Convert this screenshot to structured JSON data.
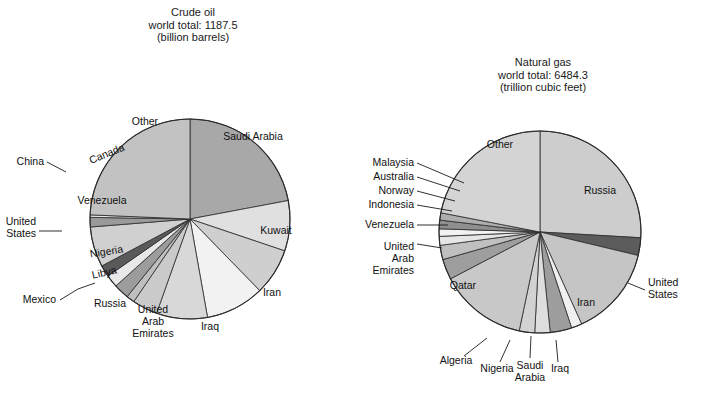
{
  "figure": {
    "width": 706,
    "height": 394,
    "background": "#ffffff"
  },
  "palette": {
    "light": "#e8e8e8",
    "lighter": "#f1f1f1",
    "white": "#fbfbfb",
    "mid_light": "#d5d5d5",
    "mid": "#c6c6c6",
    "mid2": "#bdbdbd",
    "gray": "#b0b0b0",
    "medium": "#a8a8a8",
    "dark": "#8c8c8c",
    "darker": "#6e6e6e",
    "darkest": "#5a5a5a",
    "outline": "#2b2b2b",
    "text": "#111111"
  },
  "chart_data": [
    {
      "type": "pie",
      "id": "crude-oil",
      "title": "Crude oil",
      "subtitle": "world total: 1187.5",
      "units": "(billion barrels)",
      "title_lines": [
        "Crude oil",
        "world total: 1187.5",
        "(billion barrels)"
      ],
      "total": 1187.5,
      "unit_name": "billion barrels",
      "center": [
        190,
        219
      ],
      "radius": 100,
      "start_angle_deg": 0,
      "direction": "clockwise",
      "categories": [
        "Saudi Arabia",
        "Kuwait",
        "Iran",
        "Iraq",
        "United Arab Emirates",
        "Russia",
        "Mexico",
        "Libya",
        "Nigeria",
        "United States",
        "Venezuela",
        "China",
        "Canada",
        "Other"
      ],
      "values": [
        261.7,
        96.5,
        89.7,
        112.5,
        97.8,
        48.6,
        15.7,
        29.5,
        24.0,
        22.4,
        77.2,
        18.3,
        4.7,
        288.9
      ],
      "percents": [
        22.04,
        8.13,
        7.55,
        9.47,
        8.23,
        4.09,
        1.32,
        2.48,
        2.02,
        1.89,
        6.5,
        1.54,
        0.4,
        24.34
      ],
      "slices": [
        {
          "label": "Saudi Arabia",
          "value": 261.7,
          "percent": 22.04,
          "fill": "#a8a8a8",
          "label_mode": "inside",
          "label_x": 253,
          "label_y": 140,
          "label_rot": 0,
          "label_anchor": "middle",
          "lines": [
            "Saudi Arabia"
          ]
        },
        {
          "label": "Kuwait",
          "value": 96.5,
          "percent": 8.13,
          "fill": "#e0e0e0",
          "label_mode": "inside",
          "label_x": 276,
          "label_y": 234,
          "label_rot": 0,
          "label_anchor": "middle",
          "lines": [
            "Kuwait"
          ]
        },
        {
          "label": "Iran",
          "value": 89.7,
          "percent": 7.55,
          "fill": "#cfcfcf",
          "label_mode": "inside",
          "label_x": 272,
          "label_y": 296,
          "label_rot": 0,
          "label_anchor": "middle",
          "lines": [
            "Iran"
          ]
        },
        {
          "label": "Iraq",
          "value": 112.5,
          "percent": 9.47,
          "fill": "#f2f2f2",
          "label_mode": "inside",
          "label_x": 210,
          "label_y": 330,
          "label_rot": 0,
          "label_anchor": "middle",
          "lines": [
            "Iraq"
          ]
        },
        {
          "label": "United Arab Emirates",
          "value": 97.8,
          "percent": 8.23,
          "fill": "#d8d8d8",
          "label_mode": "inside",
          "label_x": 153,
          "label_y": 313,
          "label_rot": 0,
          "label_anchor": "middle",
          "lines": [
            "United",
            "Arab",
            "Emirates"
          ]
        },
        {
          "label": "Russia",
          "value": 48.6,
          "percent": 4.09,
          "fill": "#cacaca",
          "label_mode": "inside",
          "label_x": 110,
          "label_y": 307,
          "label_rot": 0,
          "label_anchor": "middle",
          "lines": [
            "Russia"
          ]
        },
        {
          "label": "Mexico",
          "value": 15.7,
          "percent": 1.32,
          "fill": "#bfbfbf",
          "label_mode": "leader",
          "label_x": 56,
          "label_y": 303,
          "label_rot": 0,
          "label_anchor": "end",
          "leader": [
            [
              60,
              300
            ],
            [
              78,
              289
            ],
            [
              95,
              283
            ]
          ],
          "lines": [
            "Mexico"
          ]
        },
        {
          "label": "Libya",
          "value": 29.5,
          "percent": 2.48,
          "fill": "#9c9c9c",
          "label_mode": "inside",
          "label_x": 105,
          "label_y": 276,
          "label_rot": -13,
          "label_anchor": "middle",
          "lines": [
            "Libya"
          ]
        },
        {
          "label": "Nigeria",
          "value": 24.0,
          "percent": 2.02,
          "fill": "#e8e8e8",
          "label_mode": "inside",
          "label_x": 107,
          "label_y": 255,
          "label_rot": -9,
          "label_anchor": "middle",
          "lines": [
            "Nigeria"
          ]
        },
        {
          "label": "United States",
          "value": 22.4,
          "percent": 1.89,
          "fill": "#5a5a5a",
          "label_mode": "leader",
          "label_x": 36,
          "label_y": 225,
          "label_rot": 0,
          "label_anchor": "end",
          "leader": [
            [
              39,
              231
            ],
            [
              62,
              231
            ]
          ],
          "lines": [
            "United",
            "States"
          ]
        },
        {
          "label": "Venezuela",
          "value": 77.2,
          "percent": 6.5,
          "fill": "#d0d0d0",
          "label_mode": "inside",
          "label_x": 102,
          "label_y": 204,
          "label_rot": 0,
          "label_anchor": "middle",
          "lines": [
            "Venezuela"
          ]
        },
        {
          "label": "China",
          "value": 18.3,
          "percent": 1.54,
          "fill": "#9a9a9a",
          "label_mode": "leader",
          "label_x": 44,
          "label_y": 165,
          "label_rot": 0,
          "label_anchor": "end",
          "leader": [
            [
              47,
              162
            ],
            [
              66,
              172
            ]
          ],
          "lines": [
            "China"
          ]
        },
        {
          "label": "Canada",
          "value": 4.7,
          "percent": 0.4,
          "fill": "#e4e4e4",
          "label_mode": "inside",
          "label_x": 108,
          "label_y": 157,
          "label_rot": -22,
          "label_anchor": "middle",
          "lines": [
            "Canada"
          ]
        },
        {
          "label": "Other",
          "value": 288.9,
          "percent": 24.34,
          "fill": "#c2c2c2",
          "label_mode": "inside",
          "label_x": 145,
          "label_y": 125,
          "label_rot": 0,
          "label_anchor": "middle",
          "lines": [
            "Other"
          ]
        }
      ]
    },
    {
      "type": "pie",
      "id": "natural-gas",
      "title": "Natural gas",
      "subtitle": "world total: 6484.3",
      "units": "(trillion cubic feet)",
      "title_lines": [
        "Natural gas",
        "world total: 6484.3",
        "(trillion cubic feet)"
      ],
      "total": 6484.3,
      "unit_name": "trillion cubic feet",
      "center": [
        540,
        232
      ],
      "radius": 101,
      "start_angle_deg": 0,
      "direction": "clockwise",
      "categories": [
        "Russia",
        "United States",
        "Iran",
        "Iraq",
        "Saudi Arabia",
        "Nigeria",
        "Algeria",
        "Qatar",
        "United Arab Emirates",
        "Venezuela",
        "Indonesia",
        "Norway",
        "Australia",
        "Malaysia",
        "Other"
      ],
      "values": [
        1680.0,
        183.5,
        940.0,
        110.0,
        224.0,
        159.0,
        160.0,
        910.0,
        212.0,
        148.0,
        92.5,
        77.0,
        90.0,
        75.0,
        1423.3
      ],
      "percents": [
        25.91,
        2.83,
        14.5,
        1.7,
        3.45,
        2.45,
        2.47,
        14.03,
        3.27,
        2.28,
        1.43,
        1.19,
        1.39,
        1.16,
        21.95
      ],
      "slices": [
        {
          "label": "Russia",
          "value": 1680.0,
          "percent": 25.91,
          "fill": "#cdcdcd",
          "label_mode": "inside",
          "label_x": 600,
          "label_y": 194,
          "label_rot": 0,
          "label_anchor": "middle",
          "lines": [
            "Russia"
          ]
        },
        {
          "label": "United States",
          "value": 183.5,
          "percent": 2.83,
          "fill": "#5c5c5c",
          "label_mode": "leader",
          "label_x": 648,
          "label_y": 286,
          "label_rot": 0,
          "label_anchor": "start",
          "leader": [
            [
              645,
              290
            ],
            [
              628,
              283
            ]
          ],
          "lines": [
            "United",
            "States"
          ]
        },
        {
          "label": "Iran",
          "value": 940.0,
          "percent": 14.5,
          "fill": "#c5c5c5",
          "label_mode": "inside",
          "label_x": 586,
          "label_y": 306,
          "label_rot": 0,
          "label_anchor": "middle",
          "lines": [
            "Iran"
          ]
        },
        {
          "label": "Iraq",
          "value": 110.0,
          "percent": 1.7,
          "fill": "#f0f0f0",
          "label_mode": "leader",
          "label_x": 560,
          "label_y": 372,
          "label_rot": 0,
          "label_anchor": "middle",
          "leader": [
            [
              558,
              362
            ],
            [
              556,
              340
            ]
          ],
          "lines": [
            "Iraq"
          ]
        },
        {
          "label": "Saudi Arabia",
          "value": 224.0,
          "percent": 3.45,
          "fill": "#9d9d9d",
          "label_mode": "leader",
          "label_x": 530,
          "label_y": 369,
          "label_rot": 0,
          "label_anchor": "middle",
          "leader": [
            [
              530,
              358
            ],
            [
              531,
              336
            ]
          ],
          "lines": [
            "Saudi",
            "Arabia"
          ]
        },
        {
          "label": "Nigeria",
          "value": 159.0,
          "percent": 2.45,
          "fill": "#dedede",
          "label_mode": "leader",
          "label_x": 497,
          "label_y": 372,
          "label_rot": 0,
          "label_anchor": "middle",
          "leader": [
            [
              500,
              362
            ],
            [
              510,
              340
            ]
          ],
          "lines": [
            "Nigeria"
          ]
        },
        {
          "label": "Algeria",
          "value": 160.0,
          "percent": 2.47,
          "fill": "#d2d2d2",
          "label_mode": "leader",
          "label_x": 456,
          "label_y": 364,
          "label_rot": 0,
          "label_anchor": "middle",
          "leader": [
            [
              464,
              356
            ],
            [
              487,
              338
            ]
          ],
          "lines": [
            "Algeria"
          ]
        },
        {
          "label": "Qatar",
          "value": 910.0,
          "percent": 14.03,
          "fill": "#c8c8c8",
          "label_mode": "inside",
          "label_x": 463,
          "label_y": 289,
          "label_rot": 0,
          "label_anchor": "middle",
          "lines": [
            "Qatar"
          ]
        },
        {
          "label": "United Arab Emirates",
          "value": 212.0,
          "percent": 3.27,
          "fill": "#9e9e9e",
          "label_mode": "leader",
          "label_x": 414,
          "label_y": 250,
          "label_rot": 0,
          "label_anchor": "end",
          "leader": [
            [
              417,
              244
            ],
            [
              442,
              248
            ]
          ],
          "lines": [
            "United",
            "Arab",
            "Emirates"
          ]
        },
        {
          "label": "Venezuela",
          "value": 148.0,
          "percent": 2.28,
          "fill": "#c0c0c0",
          "label_mode": "leader",
          "label_x": 414,
          "label_y": 228,
          "label_rot": 0,
          "label_anchor": "end",
          "leader": [
            [
              417,
              225
            ],
            [
              448,
              225
            ]
          ],
          "lines": [
            "Venezuela"
          ]
        },
        {
          "label": "Indonesia",
          "value": 92.5,
          "percent": 1.43,
          "fill": "#e6e6e6",
          "label_mode": "leader",
          "label_x": 414,
          "label_y": 208,
          "label_rot": 0,
          "label_anchor": "end",
          "leader": [
            [
              417,
              205
            ],
            [
              452,
              211
            ]
          ],
          "lines": [
            "Indonesia"
          ]
        },
        {
          "label": "Norway",
          "value": 77.0,
          "percent": 1.19,
          "fill": "#f2f2f2",
          "label_mode": "leader",
          "label_x": 414,
          "label_y": 194,
          "label_rot": 0,
          "label_anchor": "end",
          "leader": [
            [
              417,
              191
            ],
            [
              455,
              201
            ]
          ],
          "lines": [
            "Norway"
          ]
        },
        {
          "label": "Australia",
          "value": 90.0,
          "percent": 1.39,
          "fill": "#8f8f8f",
          "label_mode": "leader",
          "label_x": 414,
          "label_y": 180,
          "label_rot": 0,
          "label_anchor": "end",
          "leader": [
            [
              417,
              177
            ],
            [
              460,
              191
            ]
          ],
          "lines": [
            "Australia"
          ]
        },
        {
          "label": "Malaysia",
          "value": 75.0,
          "percent": 1.16,
          "fill": "#aeaeae",
          "label_mode": "leader",
          "label_x": 414,
          "label_y": 166,
          "label_rot": 0,
          "label_anchor": "end",
          "leader": [
            [
              417,
              163
            ],
            [
              464,
              183
            ]
          ],
          "lines": [
            "Malaysia"
          ]
        },
        {
          "label": "Other",
          "value": 1423.3,
          "percent": 21.95,
          "fill": "#d4d4d4",
          "label_mode": "inside",
          "label_x": 500,
          "label_y": 148,
          "label_rot": 0,
          "label_anchor": "middle",
          "lines": [
            "Other"
          ]
        }
      ]
    }
  ],
  "titles": {
    "left": {
      "x": 193,
      "y": 16
    },
    "right": {
      "x": 543,
      "y": 66
    }
  }
}
